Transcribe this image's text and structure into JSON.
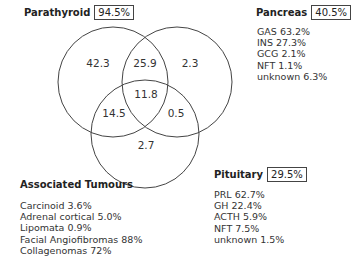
{
  "diagram": {
    "type": "venn",
    "sets": [
      {
        "name": "Parathyroid",
        "percent": "94.5%"
      },
      {
        "name": "Pancreas",
        "percent": "40.5%"
      },
      {
        "name": "Pituitary",
        "percent": "29.5%"
      }
    ],
    "regions": {
      "parathyroid_only": "42.3",
      "parathyroid_pancreas": "25.9",
      "pancreas_only": "2.3",
      "all_three": "11.8",
      "parathyroid_pituitary": "14.5",
      "pancreas_pituitary": "0.5",
      "pituitary_only": "2.7"
    },
    "pancreas_breakdown": [
      "GAS 63.2%",
      "INS 27.3%",
      "GCG 2.1%",
      "NFT 1.1%",
      "unknown 6.3%"
    ],
    "pituitary_breakdown": [
      "PRL 62.7%",
      "GH 22.4%",
      "ACTH 5.9%",
      "NFT 7.5%",
      "unknown 1.5%"
    ],
    "associated_tumours": {
      "title": "Associated Tumours",
      "items": [
        "Carcinoid 3.6%",
        "Adrenal cortical 5.0%",
        "Lipomata 0.9%",
        "Facial Angiofibromas 88%",
        "Collagenomas 72%"
      ]
    },
    "colors": {
      "stroke": "#444444",
      "text": "#222222",
      "background": "#ffffff"
    }
  }
}
